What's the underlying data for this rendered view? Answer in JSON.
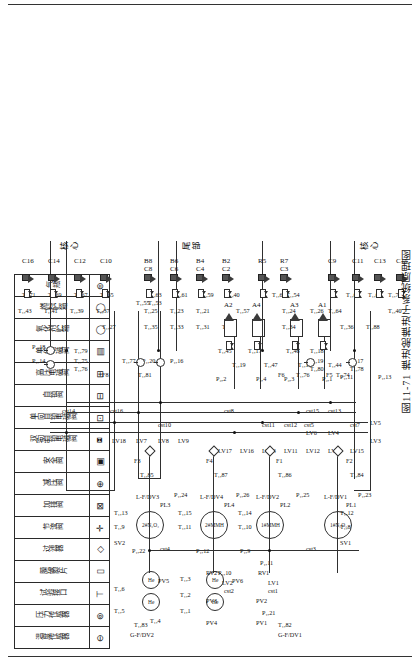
{
  "title": "图11-71 推进舱推进子系统原理图",
  "legend": {
    "title": "图例",
    "entries": [
      {
        "symbol": "⊖",
        "label": "温度传感器",
        "icon": "temperature-sensor-icon"
      },
      {
        "symbol": "⊚",
        "label": "压力传感器",
        "icon": "pressure-sensor-icon"
      },
      {
        "symbol": "⊤",
        "label": "试验接口",
        "icon": "test-port-icon"
      },
      {
        "symbol": "▯",
        "label": "膜破裂片",
        "icon": "burst-disc-icon"
      },
      {
        "symbol": "◇",
        "label": "过滤器",
        "icon": "filter-icon"
      },
      {
        "symbol": "✛",
        "label": "节流阀",
        "icon": "throttle-valve-icon"
      },
      {
        "symbol": "⊠",
        "label": "加排阀",
        "icon": "fill-drain-valve-icon"
      },
      {
        "symbol": "⊕",
        "label": "减压阀",
        "icon": "pressure-regulator-icon"
      },
      {
        "symbol": "▣",
        "label": "安全阀",
        "icon": "safety-valve-icon"
      },
      {
        "symbol": "⧈",
        "label": "双向自锁电磁阀",
        "icon": "bidirectional-latching-solenoid-valve-icon"
      },
      {
        "symbol": "⊡",
        "label": "单向自锁电磁阀",
        "icon": "unidirectional-latching-solenoid-valve-icon"
      },
      {
        "symbol": "⊟",
        "label": "自锁阀",
        "icon": "latching-valve-icon"
      },
      {
        "symbol": "⊞",
        "label": "高压电磁阀",
        "icon": "high-pressure-solenoid-valve-icon"
      },
      {
        "symbol": "▤",
        "label": "单位电磁阀",
        "icon": "single-solenoid-valve-icon"
      },
      {
        "symbol": "◯",
        "label": "氧化剂贮箱",
        "icon": "oxidizer-tank-icon"
      },
      {
        "symbol": "◯",
        "label": "燃料贮箱",
        "icon": "fuel-tank-icon"
      },
      {
        "symbol": "⊜",
        "label": "气瓶",
        "icon": "gas-bottle-icon"
      }
    ]
  },
  "zones": [
    {
      "name": "核心-top",
      "label": "核心"
    },
    {
      "name": "尾部",
      "label": "尾部"
    },
    {
      "name": "核心-bottom",
      "label": "核心"
    }
  ],
  "tanks": [
    {
      "id": "tank-1-mmh",
      "label": "1#MMH"
    },
    {
      "id": "tank-1-n2o4",
      "label": "1#N₂O₄"
    },
    {
      "id": "tank-2-mmh",
      "label": "2#MMH"
    },
    {
      "id": "tank-2-n2o4",
      "label": "2#N₂O₄"
    }
  ],
  "thruster_groups": {
    "core_top": [
      "C10",
      "C12",
      "C14",
      "C16"
    ],
    "tail_upper": [
      "C8",
      "B8",
      "C6",
      "B6",
      "C4",
      "B4",
      "C2",
      "B2"
    ],
    "tail_lower": [
      "A1",
      "A3",
      "A2",
      "A4"
    ],
    "ab_row": [
      "A1",
      "B1",
      "C1",
      "D1",
      "A3",
      "B3",
      "C3",
      "R3",
      "R5",
      "R7"
    ],
    "core_bottom": [
      "C9",
      "C11",
      "C13",
      "C15"
    ]
  },
  "labels": {
    "pressure_sensors": [
      "P₁,10",
      "P₁,11",
      "P₁,12",
      "P₁,13",
      "P₁,14",
      "P₁,16",
      "P₁,17",
      "P₁,18",
      "P₁,19",
      "P₁,20",
      "P₁,21",
      "P₁,22",
      "P₁,23",
      "P₁,24",
      "P₁,25",
      "P₁,26",
      "P₂,1",
      "P₂,2",
      "P₂,3",
      "P₂,4",
      "P₂,9"
    ],
    "temperature_sensors": [
      "T₁,8",
      "T₁,9",
      "T₁,10",
      "T₁,11",
      "T₁,12",
      "T₁,13",
      "T₁,14",
      "T₁,15",
      "T₁,16",
      "T₁,17",
      "T₁,18",
      "T₁,19",
      "T₁,20",
      "T₁,21",
      "T₁,22",
      "T₁,23",
      "T₁,24",
      "T₁,25",
      "T₁,26",
      "T₁,27",
      "T₁,28",
      "T₁,29",
      "T₁,30",
      "T₁,31",
      "T₁,32",
      "T₁,33",
      "T₁,34",
      "T₁,35",
      "T₁,36",
      "T₁,37",
      "T₁,38",
      "T₁,39",
      "T₁,40",
      "T₁,41",
      "T₁,43",
      "T₁,44",
      "T₁,45",
      "T₁,46",
      "T₁,53",
      "T₁,54",
      "T₁,55",
      "T₁,57",
      "T₁,59",
      "T₁,61",
      "T₁,62",
      "T₁,63",
      "T₁,64",
      "T₁,65",
      "T₁,66",
      "T₁,67",
      "T₁,68",
      "T₁,69",
      "T₁,70",
      "T₁,71",
      "T₁,74",
      "T₁,75",
      "T₁,76",
      "T₁,77",
      "T₁,78",
      "T₁,79",
      "T₁,80",
      "T₁,81",
      "T₁,82",
      "T₁,83",
      "T₁,84",
      "T₁,85",
      "T₁,86",
      "T₁,87",
      "T₁,88"
    ],
    "latching_valves": [
      "LV1",
      "LV2",
      "LV3",
      "LV4",
      "LV5",
      "LV6",
      "LV7",
      "LV8",
      "LV9",
      "LV10",
      "LV11",
      "LV12",
      "LV13",
      "LV14",
      "LV15",
      "LV16",
      "LV17",
      "LV18"
    ],
    "cst_ports": [
      "cst1",
      "cst2",
      "cst3",
      "cst4",
      "cst5",
      "cst7",
      "cst8",
      "cst10",
      "cst11",
      "cst12",
      "cst13",
      "cst14",
      "cst15",
      "cst16"
    ],
    "pv_valves": [
      "PV1",
      "PV2",
      "PV3",
      "PV4",
      "PV5",
      "PV6"
    ],
    "rv_valves": [
      "RV1",
      "RV2"
    ],
    "sv_valves": [
      "SV1",
      "SV2"
    ],
    "pl_ports": [
      "PL1",
      "PL2",
      "PL3",
      "PL4"
    ],
    "filters": [
      "F1",
      "F2",
      "F3",
      "F4",
      "F5",
      "F6",
      "F8"
    ],
    "fill_drain": [
      "G-F/DV1",
      "G-F/DV2",
      "L-F/DV1",
      "L-F/DV2",
      "L-F/DV3",
      "L-F/DV4"
    ]
  },
  "colors": {
    "line": "#2f2f2f",
    "text": "#111111",
    "background": "#ffffff",
    "thruster": "#3a3a3a"
  }
}
